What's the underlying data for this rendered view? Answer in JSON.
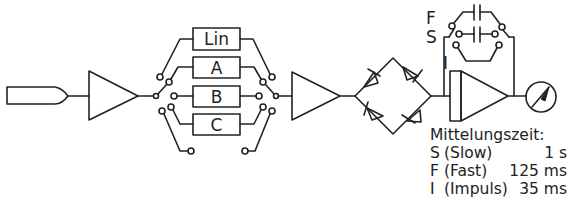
{
  "diagram": {
    "components": {
      "microphone": "microphone",
      "preamplifier": "amplifier",
      "filters": [
        {
          "label": "Lin"
        },
        {
          "label": "A"
        },
        {
          "label": "B"
        },
        {
          "label": "C"
        }
      ],
      "amplifier2": "amplifier",
      "rectifier": "bridge-rectifier",
      "integrator": "averaging-amplifier",
      "meter": "meter"
    },
    "switch_labels": {
      "fast": "F",
      "slow": "S",
      "impulse": "I"
    },
    "legend": {
      "heading": "Mittelungszeit:",
      "rows": [
        {
          "key": "S",
          "name": "(Slow)",
          "value": "1 s"
        },
        {
          "key": "F",
          "name": "(Fast)",
          "value": "125 ms"
        },
        {
          "key": "I",
          "name": "(Impuls)",
          "value": "35 ms"
        }
      ]
    },
    "colors": {
      "line": "#222222",
      "background": "#ffffff"
    }
  }
}
